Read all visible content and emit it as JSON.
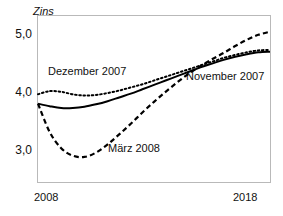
{
  "chart_data": {
    "type": "line",
    "title": "",
    "xlabel": "",
    "ylabel": "Zins",
    "ylim": [
      2.6,
      5.25
    ],
    "xlim": [
      2008,
      2018
    ],
    "yticks": [
      "3,0",
      "4,0",
      "5,0"
    ],
    "ytick_values": [
      3.0,
      4.0,
      5.0
    ],
    "xticks": [
      "2008",
      "2018"
    ],
    "xtick_values": [
      2008,
      2018
    ],
    "grid": false,
    "legend_position": "inline-annotations",
    "x": [
      2008.0,
      2008.5,
      2009.0,
      2009.5,
      2010.0,
      2010.5,
      2011.0,
      2011.5,
      2012.0,
      2012.5,
      2013.0,
      2013.5,
      2014.0,
      2014.5,
      2015.0,
      2015.5,
      2016.0,
      2016.5,
      2017.0,
      2017.5,
      2018.0
    ],
    "series": [
      {
        "name": "November 2007",
        "style": "solid",
        "color": "#000000",
        "values": [
          3.85,
          3.81,
          3.78,
          3.78,
          3.8,
          3.84,
          3.89,
          3.95,
          4.01,
          4.08,
          4.15,
          4.22,
          4.29,
          4.36,
          4.43,
          4.49,
          4.55,
          4.6,
          4.64,
          4.67,
          4.68
        ]
      },
      {
        "name": "Dezember 2007",
        "style": "dotted",
        "color": "#000000",
        "values": [
          4.0,
          4.05,
          4.04,
          4.0,
          3.98,
          3.99,
          4.02,
          4.06,
          4.11,
          4.16,
          4.22,
          4.28,
          4.34,
          4.4,
          4.46,
          4.52,
          4.58,
          4.63,
          4.67,
          4.7,
          4.71
        ]
      },
      {
        "name": "März 2008",
        "style": "dashed",
        "color": "#000000",
        "values": [
          3.85,
          3.4,
          3.14,
          3.02,
          3.0,
          3.07,
          3.2,
          3.36,
          3.53,
          3.71,
          3.88,
          4.04,
          4.19,
          4.33,
          4.45,
          4.56,
          4.66,
          4.77,
          4.87,
          4.95,
          5.0
        ]
      }
    ],
    "annotations": [
      {
        "text": "Dezember 2007",
        "x_px": 48,
        "y_px": 65
      },
      {
        "text": "November 2007",
        "x_px": 186,
        "y_px": 70
      },
      {
        "text": "März 2008",
        "x_px": 108,
        "y_px": 142
      }
    ]
  },
  "axes": {
    "y_axis_title": "Zins",
    "y_tick_top": "5,0",
    "y_tick_mid": "4,0",
    "y_tick_bottom": "3,0",
    "x_tick_left": "2008",
    "x_tick_right": "2018"
  },
  "labels": {
    "dezember": "Dezember 2007",
    "november": "November 2007",
    "maerz": "März 2008"
  }
}
